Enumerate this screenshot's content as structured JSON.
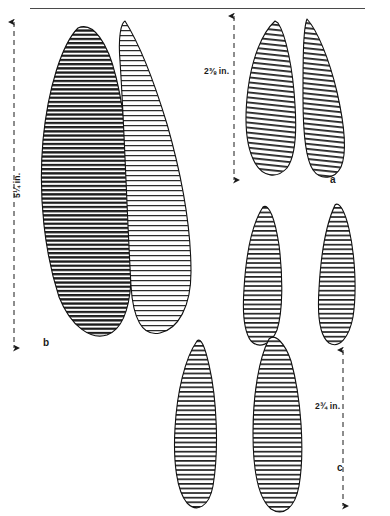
{
  "plate": {
    "kind": "archaeological-line-drawing-plate",
    "background_color": "#ffffff",
    "ink_color": "#1a1a1a",
    "top_rule": {
      "x1": 30,
      "y1": 8,
      "x2": 365,
      "y2": 8
    }
  },
  "dimensions": [
    {
      "id": "dim-b-height",
      "label": "5¼ in.",
      "orientation": "vertical",
      "label_x": 14,
      "label_y": 178,
      "arrow": {
        "x": 14,
        "y_top": 22,
        "y_bottom": 348,
        "style": "dashed-double-arrow"
      }
    },
    {
      "id": "dim-a-height",
      "label": "2⅜ in.",
      "orientation": "vertical",
      "label_x": 205,
      "label_y": 71,
      "arrow": {
        "x": 234,
        "y_top": 16,
        "y_bottom": 180,
        "style": "dashed-double-arrow"
      }
    },
    {
      "id": "dim-c-height",
      "label": "2¾ in.",
      "orientation": "vertical",
      "label_x": 316,
      "label_y": 406,
      "arrow": {
        "x": 343,
        "y_top": 350,
        "y_bottom": 506,
        "style": "dashed-double-arrow"
      }
    }
  ],
  "figure_labels": [
    {
      "id": "figure-label-a",
      "text": "a",
      "x": 330,
      "y": 180
    },
    {
      "id": "figure-label-b",
      "text": "b",
      "x": 43,
      "y": 343
    },
    {
      "id": "figure-label-c",
      "text": "c",
      "x": 337,
      "y": 468
    }
  ],
  "specimens": [
    {
      "id": "specimen-b-left",
      "group": "b",
      "description": "large leaf-shaped biface, heavy dark hatching",
      "hatch_density": "dense",
      "shade": "dark",
      "outline": "M 78 28 C 60 48 46 90 42 140 C 38 196 44 252 58 296 C 70 326 90 338 106 334 C 120 330 128 312 130 282 C 134 214 128 128 116 78 C 108 44 94 22 78 28 Z"
    },
    {
      "id": "specimen-b-right",
      "group": "b",
      "description": "large leaf-shaped biface, light hatching",
      "hatch_density": "medium",
      "shade": "light",
      "outline": "M 124 22 C 136 40 152 78 166 124 C 180 172 190 228 190 272 C 190 306 178 328 160 332 C 142 336 132 318 130 286 C 126 216 124 120 120 62 C 118 38 120 24 124 22 Z"
    },
    {
      "id": "specimen-a-left",
      "group": "a",
      "description": "small ovate point, left of pair a",
      "hatch_density": "medium",
      "shade": "medium",
      "outline": "M 274 22 C 262 34 252 58 248 88 C 244 120 246 146 254 162 C 262 176 276 178 286 168 C 294 158 296 136 294 106 C 292 70 286 36 278 24 Z"
    },
    {
      "id": "specimen-a-right",
      "group": "a",
      "description": "small ovate point, right of pair a",
      "hatch_density": "medium",
      "shade": "medium",
      "outline": "M 306 20 C 316 30 328 58 336 92 C 344 126 346 152 340 166 C 334 178 320 180 312 170 C 304 158 302 132 302 98 C 302 62 302 30 306 20 Z"
    },
    {
      "id": "specimen-c-upper-left",
      "group": "c",
      "description": "narrow blade, broken mid-section, upper left of group c",
      "hatch_density": "medium",
      "shade": "medium",
      "outline": "M 262 208 C 252 224 246 254 244 288 C 242 316 244 332 250 340 C 258 348 270 344 276 330 C 282 312 282 278 278 246 C 274 220 268 204 262 208 Z"
    },
    {
      "id": "specimen-c-upper-right",
      "group": "c",
      "description": "narrow blade, upper right of group c",
      "hatch_density": "medium",
      "shade": "medium",
      "outline": "M 334 206 C 326 222 320 252 318 288 C 316 318 320 336 328 342 C 338 348 348 338 352 318 C 356 292 354 256 348 230 C 344 212 338 202 334 206 Z"
    },
    {
      "id": "specimen-c-lower-left",
      "group": "c",
      "description": "narrow blade, lower left of group c",
      "hatch_density": "medium",
      "shade": "medium",
      "outline": "M 196 342 C 184 358 176 392 174 428 C 172 462 176 490 186 502 C 196 512 208 506 212 486 C 218 452 216 400 208 366 C 204 348 200 338 196 342 Z"
    },
    {
      "id": "specimen-c-lower-right",
      "group": "c",
      "description": "narrow blade, lower right of group c",
      "hatch_density": "medium",
      "shade": "medium",
      "outline": "M 268 340 C 258 358 252 394 252 432 C 252 470 258 498 270 508 C 282 516 294 508 298 486 C 304 452 300 398 290 362 C 284 344 274 334 268 340 Z"
    }
  ]
}
